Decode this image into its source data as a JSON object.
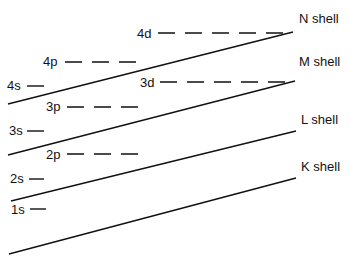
{
  "diagram": {
    "title": "",
    "shells": [
      {
        "label": "N shell",
        "x": 299,
        "y": 12
      },
      {
        "label": "M shell",
        "x": 299,
        "y": 55
      },
      {
        "label": "L shell",
        "x": 301,
        "y": 114
      },
      {
        "label": "K shell",
        "x": 301,
        "y": 161
      }
    ],
    "subshells": [
      {
        "label": "4d",
        "x": 137,
        "y": 29,
        "dashes": 5
      },
      {
        "label": "4p",
        "x": 43,
        "y": 56,
        "dashes": 3
      },
      {
        "label": "4s",
        "x": 7,
        "y": 80,
        "dashes": 1
      },
      {
        "label": "3d",
        "x": 141,
        "y": 77,
        "dashes": 5
      },
      {
        "label": "3p",
        "x": 46,
        "y": 101,
        "dashes": 3
      },
      {
        "label": "3s",
        "x": 9,
        "y": 125,
        "dashes": 1
      },
      {
        "label": "2p",
        "x": 46,
        "y": 150,
        "dashes": 3
      },
      {
        "label": "2s",
        "x": 10,
        "y": 174,
        "dashes": 1
      },
      {
        "label": "1s",
        "x": 10,
        "y": 204,
        "dashes": 1
      }
    ],
    "shell_lines": [
      {
        "name": "N",
        "x1": 8,
        "y1": 104,
        "x2": 293,
        "y2": 32
      },
      {
        "name": "M",
        "x1": 8,
        "y1": 155,
        "x2": 295,
        "y2": 81
      },
      {
        "name": "L",
        "x1": 11,
        "y1": 201,
        "x2": 296,
        "y2": 131
      },
      {
        "name": "K",
        "x1": 9,
        "y1": 254,
        "x2": 296,
        "y2": 178
      }
    ]
  }
}
